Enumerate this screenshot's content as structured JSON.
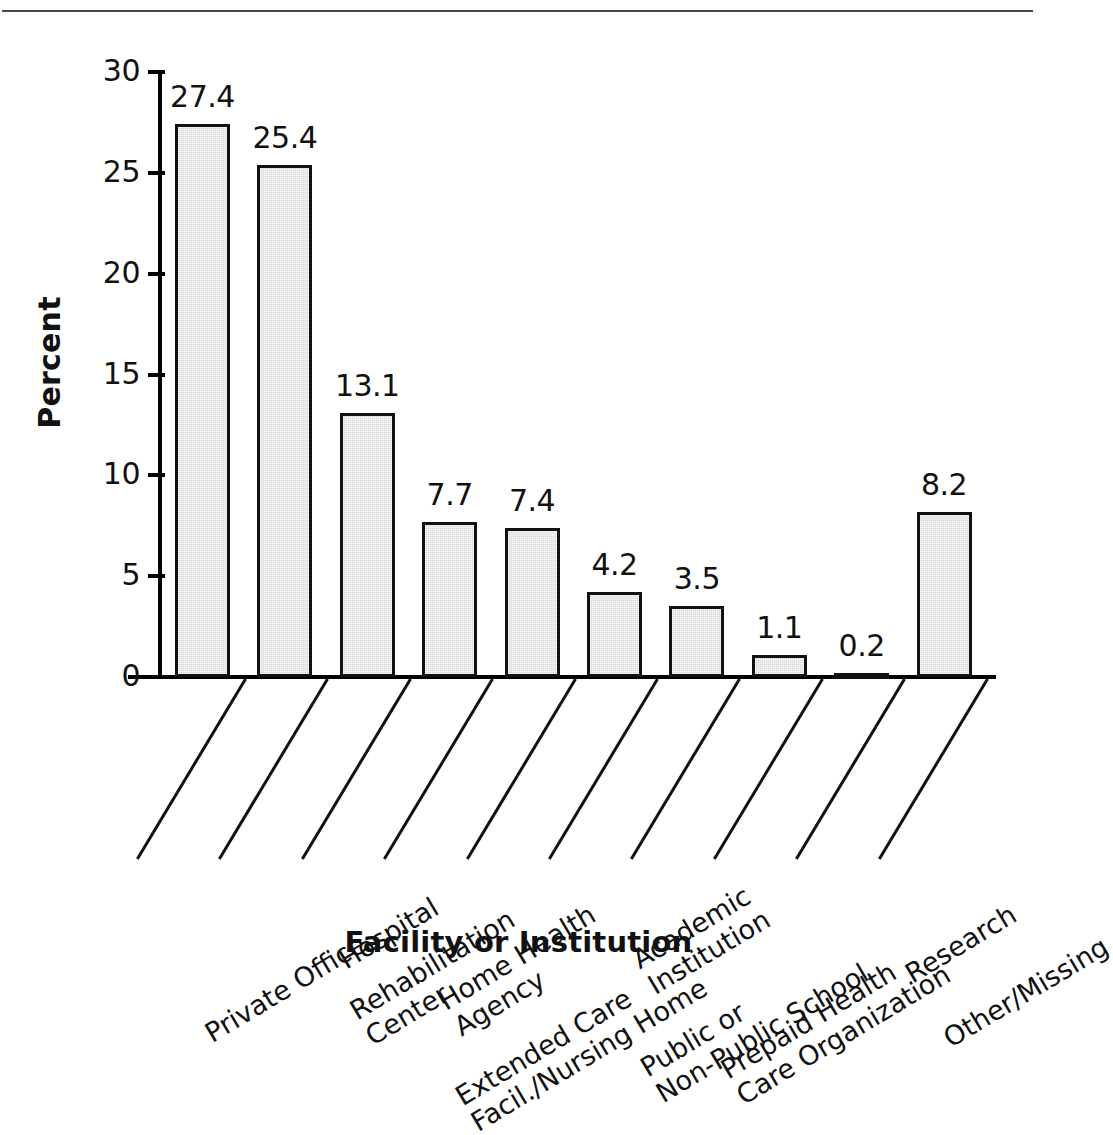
{
  "chart_data": {
    "type": "bar",
    "title": "",
    "xlabel": "Facility or Institution",
    "ylabel": "Percent",
    "ylim": [
      0,
      30
    ],
    "ytick_labels": [
      "30",
      "25",
      "20",
      "15",
      "10",
      "5",
      "0"
    ],
    "ytick_values": [
      30,
      25,
      20,
      15,
      10,
      5,
      0
    ],
    "grid": false,
    "legend": false,
    "bar_fill_color": "#d8d8d8",
    "bar_edge_color": "#111111",
    "categories": [
      "Private Office",
      "Hospital",
      "Rehabilitation Center",
      "Home Health Agency",
      "Extended Care Facil./Nursing Home",
      "Academic Institution",
      "Public or Non-Public School",
      "Prepaid Health Care Organization",
      "Research",
      "Other/Missing"
    ],
    "category_lines": [
      [
        "Private Office"
      ],
      [
        "Hospital"
      ],
      [
        "Rehabilitation",
        "Center"
      ],
      [
        "Home Health",
        "Agency"
      ],
      [
        "Extended Care",
        "Facil./Nursing Home"
      ],
      [
        "Academic",
        "Institution"
      ],
      [
        "Public or",
        "Non-Public School"
      ],
      [
        "Prepaid Health",
        "Care Organization"
      ],
      [
        "Research"
      ],
      [
        "Other/Missing"
      ]
    ],
    "values": [
      27.4,
      25.4,
      13.1,
      7.7,
      7.4,
      4.2,
      3.5,
      1.1,
      0.2,
      8.2
    ],
    "value_labels": [
      "27.4",
      "25.4",
      "13.1",
      "7.7",
      "7.4",
      "4.2",
      "3.5",
      "1.1",
      "0.2",
      "8.2"
    ]
  }
}
